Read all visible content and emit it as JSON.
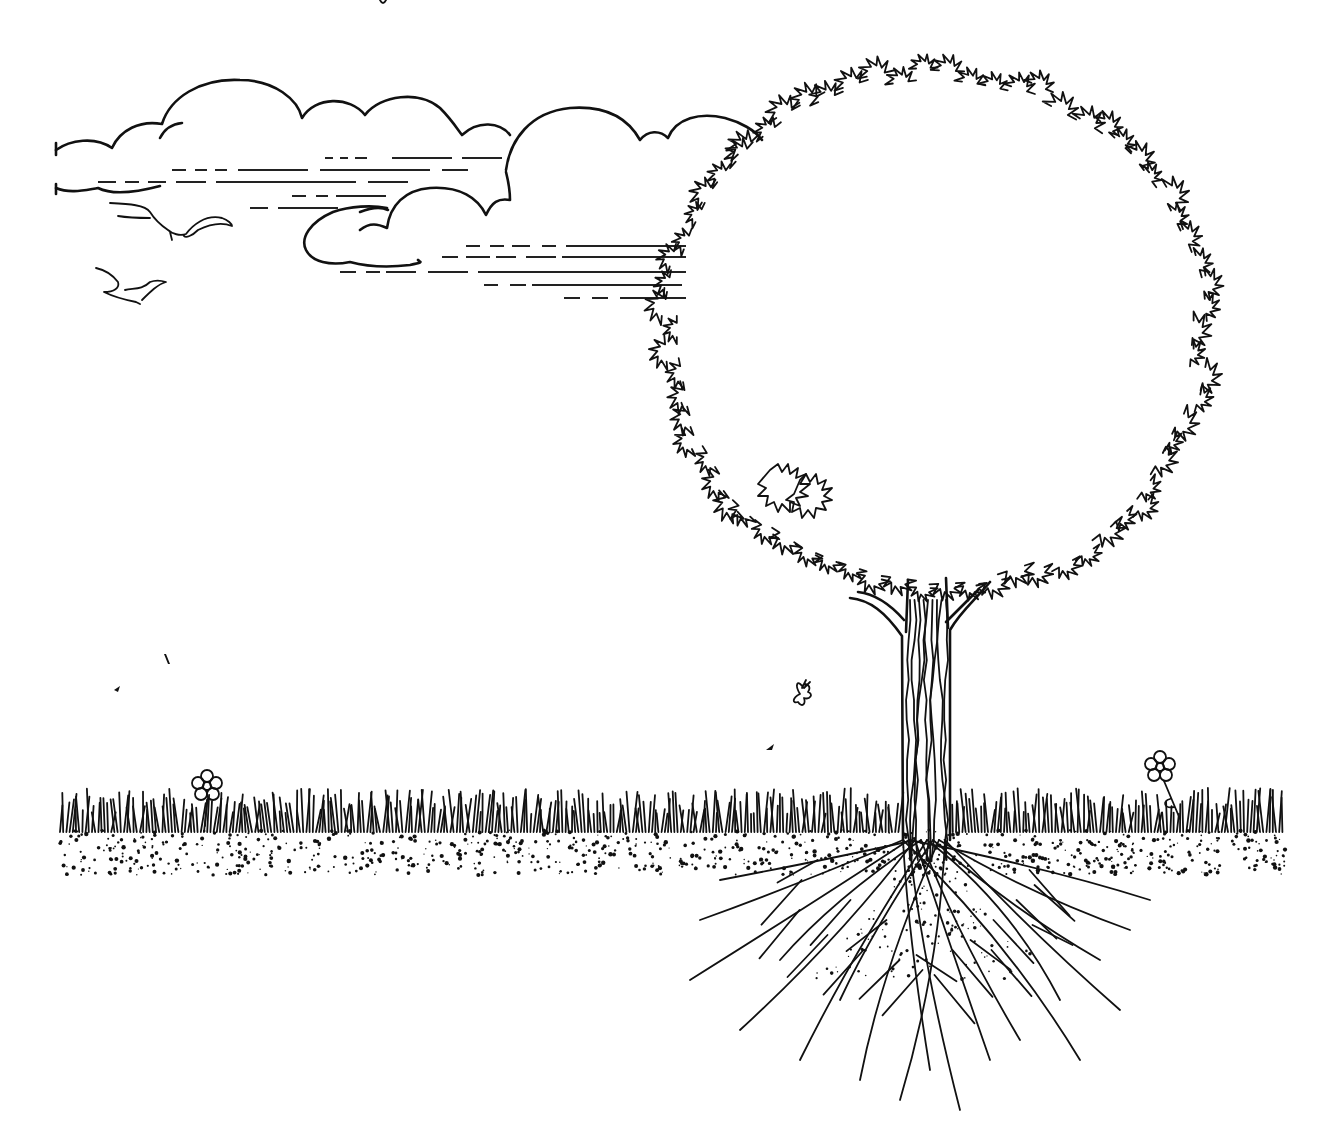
{
  "scene": {
    "title": "Tree with roots illustration",
    "style": "black-and-white line art",
    "colors": {
      "ink": "#111111",
      "background": "#ffffff"
    },
    "elements": {
      "clouds": {
        "count": 3,
        "label": "clouds with wind streaks"
      },
      "birds": {
        "count": 2,
        "label": "seagulls flying"
      },
      "tree": {
        "label": "round-crowned tree",
        "crown_shape": "ring of leaf clusters"
      },
      "trunk": {
        "label": "textured trunk"
      },
      "roots": {
        "label": "spreading root system below ground"
      },
      "grass": {
        "label": "grass strip"
      },
      "soil": {
        "label": "speckled soil"
      },
      "flowers": {
        "count": 2,
        "label": "daisy flowers"
      },
      "butterfly": {
        "label": "butterfly"
      },
      "falling_leaves": {
        "count": 3,
        "label": "falling leaves"
      }
    }
  }
}
